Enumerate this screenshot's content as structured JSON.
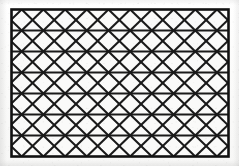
{
  "figure": {
    "kind": "line-drawing",
    "caption": "",
    "width": 239,
    "height": 166
  },
  "colors": {
    "page_background": "#fcfcfb",
    "paper_fill": "#fafaf9",
    "line": "#1a1a1a",
    "frame": "#111111",
    "margin_tint": "#f2f2f1"
  },
  "frame": {
    "x": 11.5,
    "y": 9.5,
    "width": 217,
    "height": 147,
    "stroke_width": 2.6
  },
  "lattice": {
    "rows": 7,
    "row_height": 21.0,
    "half_period": 21.7,
    "columns": 10,
    "diagonal_stroke_width": 2.1,
    "horizontal_stroke_width": 2.0,
    "description": "isometric triangular lattice of equilateral triangles formed by horizontal rules and two families of diagonals",
    "horizontal_lines_y": [
      9.5,
      30.5,
      51.5,
      72.5,
      93.5,
      114.5,
      135.5,
      156.5
    ],
    "vertical_nodes_x": [
      11.5,
      33.2,
      54.9,
      76.6,
      98.3,
      120.0,
      141.7,
      163.4,
      185.1,
      206.8,
      228.5
    ]
  }
}
